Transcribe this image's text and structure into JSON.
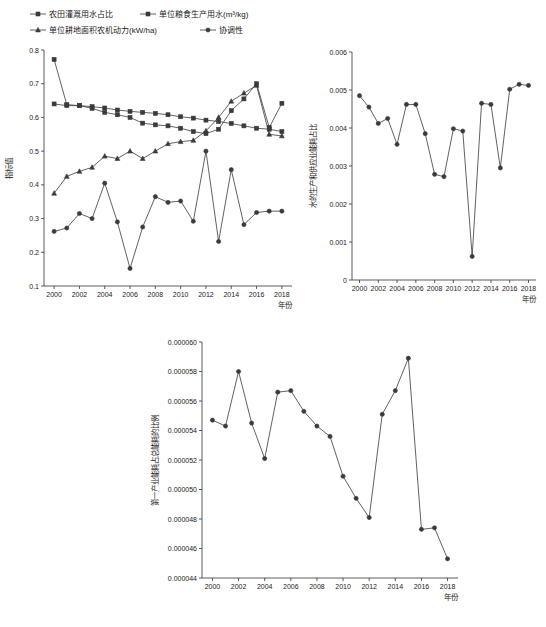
{
  "charts": [
    {
      "id": "panel-a",
      "type": "line",
      "title": "",
      "xlabel": "年份",
      "ylabel": "指标值",
      "xlim": [
        1999.2,
        2018.8
      ],
      "ylim": [
        0.1,
        0.8
      ],
      "xticks": [
        2000,
        2002,
        2004,
        2006,
        2008,
        2010,
        2012,
        2014,
        2016,
        2018
      ],
      "yticks": [
        "0.1",
        "0.2",
        "0.3",
        "0.4",
        "0.5",
        "0.6",
        "0.7",
        "0.8"
      ],
      "x": [
        2000,
        2001,
        2002,
        2003,
        2004,
        2005,
        2006,
        2007,
        2008,
        2009,
        2010,
        2011,
        2012,
        2013,
        2014,
        2015,
        2016,
        2017,
        2018
      ],
      "legend": [
        {
          "name": "农田灌溉用水占比",
          "marker": "square"
        },
        {
          "name": "单位粮食生产用水(m³/kg)",
          "marker": "square"
        },
        {
          "name": "单位耕地面积农机动力(kW/ha)",
          "marker": "triangle"
        },
        {
          "name": "协调性",
          "marker": "circle"
        }
      ],
      "series": [
        {
          "name": "农田灌溉用水占比",
          "marker": "square",
          "values": [
            0.64,
            0.635,
            0.635,
            0.632,
            0.628,
            0.622,
            0.618,
            0.615,
            0.612,
            0.608,
            0.602,
            0.598,
            0.592,
            0.588,
            0.582,
            0.575,
            0.568,
            0.565,
            0.558
          ]
        },
        {
          "name": "单位粮食生产用水(m³/kg)",
          "marker": "square",
          "values": [
            0.772,
            0.638,
            0.635,
            0.627,
            0.615,
            0.608,
            0.6,
            0.583,
            0.578,
            0.575,
            0.568,
            0.558,
            0.552,
            0.565,
            0.62,
            0.655,
            0.7,
            0.57,
            0.642
          ]
        },
        {
          "name": "单位耕地面积农机动力(kW/ha)",
          "marker": "triangle",
          "values": [
            0.375,
            0.425,
            0.44,
            0.452,
            0.485,
            0.478,
            0.5,
            0.478,
            0.5,
            0.522,
            0.528,
            0.532,
            0.56,
            0.6,
            0.648,
            0.672,
            0.695,
            0.55,
            0.545
          ]
        },
        {
          "name": "协调性",
          "marker": "circle",
          "values": [
            0.262,
            0.272,
            0.315,
            0.3,
            0.405,
            0.29,
            0.152,
            0.275,
            0.365,
            0.348,
            0.352,
            0.292,
            0.5,
            0.232,
            0.445,
            0.282,
            0.318,
            0.322,
            0.322
          ]
        }
      ]
    },
    {
      "id": "panel-b",
      "type": "line",
      "title": "",
      "xlabel": "年份",
      "ylabel": "水的生产和供应业能耗占比",
      "xlim": [
        1999.2,
        2018.8
      ],
      "ylim": [
        0.0,
        0.006
      ],
      "xticks": [
        2000,
        2002,
        2004,
        2006,
        2008,
        2010,
        2012,
        2014,
        2016,
        2018
      ],
      "yticks": [
        "0",
        "0.001",
        "0.002",
        "0.003",
        "0.004",
        "0.005",
        "0.006"
      ],
      "x": [
        2000,
        2001,
        2002,
        2003,
        2004,
        2005,
        2006,
        2007,
        2008,
        2009,
        2010,
        2011,
        2012,
        2013,
        2014,
        2015,
        2016,
        2017,
        2018
      ],
      "series": [
        {
          "name": "水的生产和供应业能耗占比",
          "marker": "circle",
          "values": [
            0.00485,
            0.00455,
            0.00412,
            0.00425,
            0.00357,
            0.00462,
            0.00462,
            0.00385,
            0.00278,
            0.00272,
            0.00398,
            0.00392,
            0.00062,
            0.00465,
            0.00462,
            0.00295,
            0.00502,
            0.00515,
            0.00512
          ]
        }
      ]
    },
    {
      "id": "panel-c",
      "type": "line",
      "title": "",
      "xlabel": "年份",
      "ylabel": "第一产业能耗占总能耗的比例",
      "xlim": [
        1999.2,
        2018.8
      ],
      "ylim": [
        4.4e-05,
        6e-05
      ],
      "xticks": [
        2000,
        2002,
        2004,
        2006,
        2008,
        2010,
        2012,
        2014,
        2016,
        2018
      ],
      "yticks": [
        "0.000044",
        "0.000046",
        "0.000048",
        "0.000050",
        "0.000052",
        "0.000054",
        "0.000056",
        "0.000058",
        "0.000060"
      ],
      "x": [
        2000,
        2001,
        2002,
        2003,
        2004,
        2005,
        2006,
        2007,
        2008,
        2009,
        2010,
        2011,
        2012,
        2013,
        2014,
        2015,
        2016,
        2017,
        2018
      ],
      "series": [
        {
          "name": "第一产业能耗占总能耗的比例",
          "marker": "circle",
          "values": [
            5.47e-05,
            5.43e-05,
            5.8e-05,
            5.45e-05,
            5.21e-05,
            5.66e-05,
            5.67e-05,
            5.53e-05,
            5.43e-05,
            5.36e-05,
            5.09e-05,
            4.94e-05,
            4.81e-05,
            5.51e-05,
            5.67e-05,
            5.89e-05,
            4.73e-05,
            4.74e-05,
            4.53e-05
          ]
        }
      ]
    }
  ]
}
